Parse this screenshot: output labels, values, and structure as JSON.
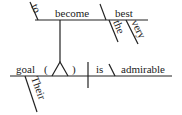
{
  "diagram": {
    "type": "sentence-diagram",
    "words": {
      "to": "to",
      "become": "become",
      "best": "best",
      "the": "the",
      "very": "very",
      "goal": "goal",
      "paren_open": "(",
      "paren_close": ")",
      "is": "is",
      "admirable": "admirable",
      "their": "Their"
    }
  }
}
